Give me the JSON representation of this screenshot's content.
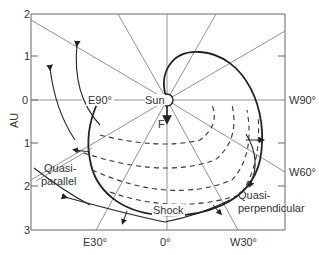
{
  "diagram": {
    "y_axis": {
      "label": "AU",
      "ticks": [
        "2",
        "1",
        "0",
        "1",
        "2",
        "3"
      ]
    },
    "x_axis_labels": {
      "e30": "E30°",
      "zero": "0°",
      "w30": "W30°"
    },
    "side_labels": {
      "e90": "E90°",
      "w90": "W90°",
      "w60": "W60°"
    },
    "sun_label": "Sun",
    "flare_label": "F",
    "shock_label": "Shock",
    "quasi_parallel": [
      "Quasi-",
      "parallel"
    ],
    "quasi_perpendicular": [
      "Quasi-",
      "perpendicular"
    ],
    "colors": {
      "line": "#555555",
      "heavy": "#222222",
      "background": "#ffffff"
    }
  }
}
